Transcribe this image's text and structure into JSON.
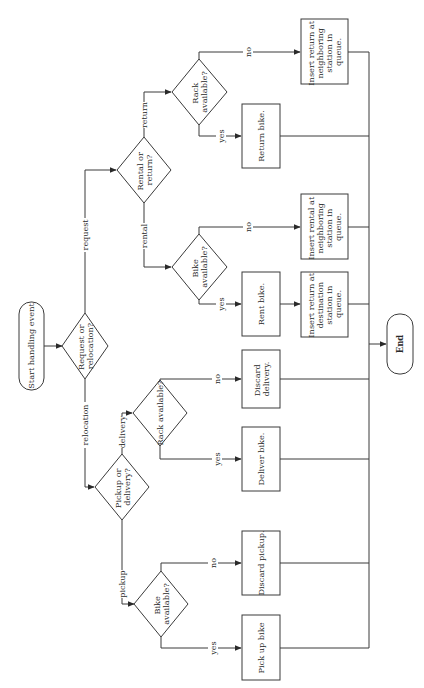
{
  "diagram": {
    "type": "flowchart",
    "orientation": "rotated-90-ccw",
    "nodes": {
      "start": {
        "label": "Start handling event",
        "shape": "terminal"
      },
      "q_request_relocation": {
        "label_lines": [
          "Request or",
          "relocation?"
        ],
        "shape": "decision"
      },
      "q_rental_return": {
        "label_lines": [
          "Rental or",
          "return?"
        ],
        "shape": "decision"
      },
      "q_rack_return": {
        "label_lines": [
          "Rack",
          "available?"
        ],
        "shape": "decision"
      },
      "insert_return_neighbor": {
        "label_lines": [
          "Insert return at",
          "neighboring",
          "station in",
          "queue."
        ],
        "shape": "process"
      },
      "return_bike": {
        "label": "Return bike.",
        "shape": "process"
      },
      "q_bike_rental": {
        "label_lines": [
          "Bike",
          "available?"
        ],
        "shape": "decision"
      },
      "insert_rental_neighbor": {
        "label_lines": [
          "Insert rental at",
          "neighboring",
          "station in",
          "queue."
        ],
        "shape": "process"
      },
      "rent_bike": {
        "label": "Rent bike.",
        "shape": "process"
      },
      "insert_return_destination": {
        "label_lines": [
          "Insert return at",
          "destination",
          "station in",
          "queue."
        ],
        "shape": "process"
      },
      "q_pickup_delivery": {
        "label_lines": [
          "Pickup or",
          "delivery?"
        ],
        "shape": "decision"
      },
      "q_rack_delivery": {
        "label": "Rack available?",
        "shape": "decision"
      },
      "discard_delivery": {
        "label_lines": [
          "Discard",
          "delivery."
        ],
        "shape": "process"
      },
      "deliver_bike": {
        "label": "Deliver bike.",
        "shape": "process"
      },
      "q_bike_pickup": {
        "label_lines": [
          "Bike",
          "available?"
        ],
        "shape": "decision"
      },
      "discard_pickup": {
        "label": "Discard pickup.",
        "shape": "process"
      },
      "pick_up_bike": {
        "label": "Pick up bike",
        "shape": "process"
      },
      "end": {
        "label": "End",
        "shape": "terminal"
      }
    },
    "edges": {
      "request": "request",
      "relocation": "relocation",
      "rental": "rental",
      "return": "return",
      "delivery": "delivery",
      "pickup": "pickup",
      "yes": "yes",
      "no": "no"
    },
    "colors": {
      "stroke": "#3a3a3a",
      "text": "#2a2a2a",
      "background": "#ffffff"
    }
  }
}
